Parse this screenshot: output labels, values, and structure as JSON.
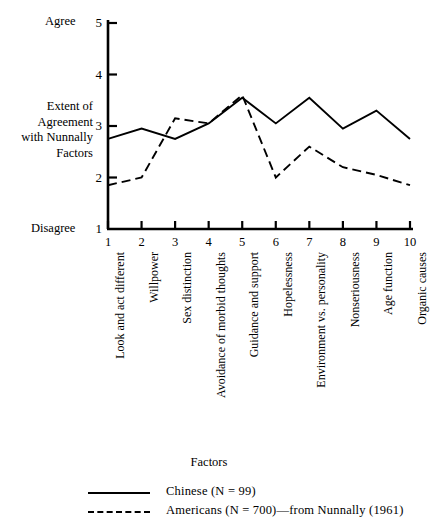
{
  "chart_data": {
    "type": "line",
    "title": "",
    "xlabel": "Factors",
    "ylabel": "Extent of Agreement with Nunnally Factors",
    "ylim": [
      1,
      5
    ],
    "xlim": [
      1,
      10
    ],
    "grid": false,
    "legend_position": "bottom",
    "y_axis_title_lines": [
      "Extent of",
      "Agreement",
      "with Nunnally",
      "Factors"
    ],
    "y_low_label": "Disagree",
    "y_high_label": "Agree",
    "y_ticks": [
      1,
      2,
      3,
      4,
      5
    ],
    "y_tick_labels": [
      "1",
      "2",
      "3",
      "4",
      "5"
    ],
    "x_ticks": [
      1,
      2,
      3,
      4,
      5,
      6,
      7,
      8,
      9,
      10
    ],
    "x_tick_labels": [
      "1",
      "2",
      "3",
      "4",
      "5",
      "6",
      "7",
      "8",
      "9",
      "10"
    ],
    "categories": [
      "Look and act different",
      "Willpower",
      "Sex distinction",
      "Avoidance of morbid thoughts",
      "Guidance and support",
      "Hopelessness",
      "Environment vs. personality",
      "Nonseriousness",
      "Age function",
      "Organic causes"
    ],
    "series": [
      {
        "name": "Chinese (N = 99)",
        "style": "solid",
        "color": "#000000",
        "values": [
          2.75,
          2.95,
          2.75,
          3.05,
          3.55,
          3.05,
          3.55,
          2.95,
          3.3,
          2.75
        ]
      },
      {
        "name": "Americans (N = 700)—from Nunnally (1961)",
        "style": "dashed",
        "color": "#000000",
        "values": [
          1.85,
          2.0,
          3.15,
          3.05,
          3.6,
          2.0,
          2.6,
          2.2,
          2.05,
          1.85
        ]
      }
    ],
    "legend": [
      {
        "label": "Chinese (N = 99)",
        "style": "solid"
      },
      {
        "label": "Americans (N = 700)—from Nunnally (1961)",
        "style": "dashed"
      }
    ]
  }
}
